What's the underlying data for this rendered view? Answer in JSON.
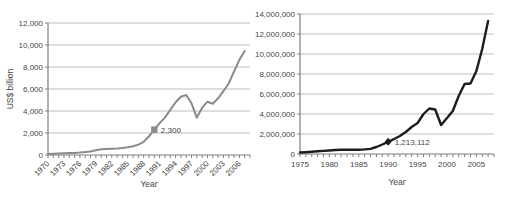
{
  "colors": {
    "background": "#ffffff",
    "text": "#454545",
    "grid": "#bdbdbd",
    "axis": "#7f7f7f"
  },
  "chart_data": [
    {
      "type": "line",
      "title": "",
      "xlabel": "Year",
      "ylabel": "US$ billion",
      "ylim": [
        0,
        12000
      ],
      "ytick_step": 2000,
      "ytick_labels": [
        "0",
        "2,000",
        "4,000",
        "6,000",
        "8,000",
        "10,000",
        "12,000"
      ],
      "xticks_major": [
        1970,
        1973,
        1976,
        1979,
        1982,
        1985,
        1988,
        1991,
        1994,
        1997,
        2000,
        2003,
        2006
      ],
      "xtick_rotation": -45,
      "grid": true,
      "legend": "none",
      "line_color": "#8a8a8a",
      "line_width": 2,
      "x": [
        1970,
        1971,
        1972,
        1973,
        1974,
        1975,
        1976,
        1977,
        1978,
        1979,
        1980,
        1981,
        1982,
        1983,
        1984,
        1985,
        1986,
        1987,
        1988,
        1989,
        1990,
        1991,
        1992,
        1993,
        1994,
        1995,
        1996,
        1997,
        1998,
        1999,
        2000,
        2001,
        2002,
        2003,
        2004,
        2005,
        2006,
        2007
      ],
      "values": [
        100,
        110,
        125,
        150,
        175,
        195,
        220,
        260,
        330,
        430,
        530,
        555,
        565,
        585,
        625,
        700,
        800,
        950,
        1200,
        1700,
        2300,
        2900,
        3400,
        4100,
        4800,
        5300,
        5450,
        4700,
        3400,
        4300,
        4850,
        4650,
        5150,
        5800,
        6500,
        7600,
        8650,
        9450
      ],
      "marker": {
        "year": 1990,
        "value": 2300,
        "label": "2,300",
        "shape": "square",
        "color": "#8a8a8a"
      }
    },
    {
      "type": "line",
      "title": "",
      "xlabel": "Year",
      "ylabel": "",
      "ylim": [
        0,
        14000000
      ],
      "ytick_step": 2000000,
      "ytick_labels": [
        "0",
        "2,000,000",
        "4,000,000",
        "6,000,000",
        "8,000,000",
        "10,000,000",
        "12,000,000",
        "14,000,000"
      ],
      "xticks_major": [
        1975,
        1980,
        1985,
        1990,
        1995,
        2000,
        2005
      ],
      "xtick_rotation": 0,
      "grid": true,
      "legend": "none",
      "line_color": "#1c1c1c",
      "line_width": 2.4,
      "x": [
        1975,
        1976,
        1977,
        1978,
        1979,
        1980,
        1981,
        1982,
        1983,
        1984,
        1985,
        1986,
        1987,
        1988,
        1989,
        1990,
        1991,
        1992,
        1993,
        1994,
        1995,
        1996,
        1997,
        1998,
        1999,
        2000,
        2001,
        2002,
        2003,
        2004,
        2005,
        2006,
        2007
      ],
      "values": [
        150000,
        180000,
        220000,
        270000,
        310000,
        350000,
        400000,
        430000,
        440000,
        430000,
        430000,
        455000,
        510000,
        700000,
        950000,
        1213112,
        1500000,
        1800000,
        2200000,
        2700000,
        3100000,
        4000000,
        4550000,
        4450000,
        2900000,
        3600000,
        4300000,
        5800000,
        7000000,
        7050000,
        8300000,
        10500000,
        13300000
      ],
      "marker": {
        "year": 1990,
        "value": 1213112,
        "label": "1,213,112",
        "shape": "diamond",
        "color": "#1c1c1c"
      }
    }
  ]
}
